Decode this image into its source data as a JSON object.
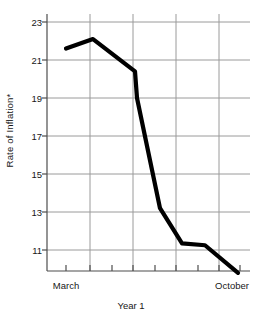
{
  "chart_data": {
    "type": "line",
    "title": "",
    "xlabel": "Year 1",
    "ylabel": "Rate of Inflation*",
    "x": [
      66,
      93,
      135,
      137,
      160,
      182,
      205,
      238
    ],
    "values": [
      21.6,
      22.1,
      20.4,
      19.0,
      13.2,
      11.35,
      11.25,
      9.8
    ],
    "categories": [
      "March",
      "",
      "",
      "",
      "",
      "",
      "",
      "October"
    ],
    "ylim": [
      9.4,
      23.9
    ],
    "yticks": [
      23,
      21,
      19,
      17,
      15,
      13,
      11
    ],
    "ytick_labels": [
      "23",
      "21",
      "19",
      "17",
      "15",
      "13",
      "11"
    ],
    "xtick_labels": [
      "March",
      "October"
    ],
    "grid": "both",
    "legend": "none",
    "series": [
      {
        "name": "Rate of Inflation*",
        "values": [
          21.6,
          22.1,
          20.4,
          19.0,
          13.2,
          11.35,
          11.25,
          9.8
        ]
      }
    ],
    "line_color": "#000000",
    "grid_color": "#999999",
    "axis_color": "#555555"
  },
  "axes": {
    "y_title": "Rate of Inflation*",
    "x_title": "Year 1",
    "y_tick_labels": [
      "23",
      "21",
      "19",
      "17",
      "15",
      "13",
      "11"
    ],
    "x_tick_labels": [
      {
        "label": "March",
        "x": 66
      },
      {
        "label": "October",
        "x": 238
      }
    ]
  }
}
